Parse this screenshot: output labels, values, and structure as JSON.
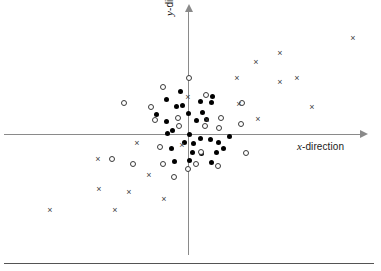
{
  "chart_data": {
    "type": "scatter",
    "title": "",
    "xlabel": "x-direction",
    "ylabel": "y-direction",
    "xlabel_var": "x",
    "xlabel_rest": "-direction",
    "ylabel_var": "y",
    "ylabel_rest": "-direction",
    "grid": false,
    "legend": "none",
    "axes_style": "arrowed-crosshair-through-origin",
    "origin_px": [
      188,
      134
    ],
    "xlim_px": [
      4,
      362
    ],
    "ylim_px": [
      11,
      255
    ],
    "series": [
      {
        "name": "filled-dot",
        "marker": "filled-circle",
        "color": "#000000",
        "points": [
          [
            166,
            99
          ],
          [
            180,
            91
          ],
          [
            176,
            106
          ],
          [
            156,
            114
          ],
          [
            166,
            121
          ],
          [
            172,
            130
          ],
          [
            188,
            113
          ],
          [
            189,
            134
          ],
          [
            182,
            105
          ],
          [
            200,
            101
          ],
          [
            211,
            102
          ],
          [
            202,
            112
          ],
          [
            206,
            119
          ],
          [
            212,
            96
          ],
          [
            196,
            120
          ],
          [
            184,
            142
          ],
          [
            193,
            143
          ],
          [
            200,
            138
          ],
          [
            210,
            139
          ],
          [
            218,
            142
          ],
          [
            229,
            136
          ],
          [
            216,
            152
          ],
          [
            201,
            153
          ],
          [
            211,
            162
          ],
          [
            223,
            148
          ],
          [
            189,
            160
          ],
          [
            174,
            161
          ],
          [
            171,
            148
          ],
          [
            167,
            133
          ],
          [
            192,
            152
          ]
        ]
      },
      {
        "name": "open-circle",
        "marker": "open-circle",
        "color": "#3a3a3a",
        "points": [
          [
            163,
            87
          ],
          [
            124,
            103
          ],
          [
            151,
            107
          ],
          [
            189,
            78
          ],
          [
            206,
            95
          ],
          [
            178,
            118
          ],
          [
            179,
            126
          ],
          [
            205,
            126
          ],
          [
            221,
            118
          ],
          [
            219,
            128
          ],
          [
            241,
            124
          ],
          [
            246,
            153
          ],
          [
            201,
            152
          ],
          [
            218,
            166
          ],
          [
            160,
            147
          ],
          [
            133,
            164
          ],
          [
            163,
            164
          ],
          [
            174,
            177
          ],
          [
            196,
            164
          ],
          [
            155,
            120
          ],
          [
            112,
            159
          ],
          [
            242,
            103
          ],
          [
            188,
            169
          ]
        ]
      },
      {
        "name": "cross",
        "marker": "x",
        "color": "#3f3f3f",
        "points": [
          [
            188,
            97
          ],
          [
            207,
            120
          ],
          [
            182,
            145
          ],
          [
            137,
            143
          ],
          [
            98,
            159
          ],
          [
            149,
            175
          ],
          [
            99,
            189
          ],
          [
            129,
            192
          ],
          [
            164,
            199
          ],
          [
            50,
            210
          ],
          [
            115,
            210
          ],
          [
            237,
            78
          ],
          [
            256,
            62
          ],
          [
            280,
            53
          ],
          [
            239,
            104
          ],
          [
            258,
            119
          ],
          [
            280,
            82
          ],
          [
            297,
            78
          ],
          [
            312,
            107
          ],
          [
            353,
            38
          ]
        ]
      }
    ]
  },
  "labels": {
    "x_axis": "x-direction",
    "y_axis": "y-direction"
  }
}
